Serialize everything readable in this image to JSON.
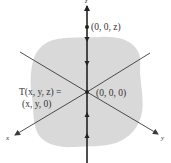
{
  "diagram": {
    "axes": {
      "x_label": "x",
      "y_label": "y",
      "z_label": "z"
    },
    "points": {
      "top_point_label": "(0, 0, z)",
      "origin_label": "(0, 0, 0)"
    },
    "transform": {
      "line1": "T(x, y, z) =",
      "line2": "(x, y, 0)"
    },
    "colors": {
      "plane_fill": "#d9d9d9",
      "axis_stroke": "#3a3a3a",
      "z_axis_stroke": "#222222",
      "text": "#333333"
    }
  }
}
